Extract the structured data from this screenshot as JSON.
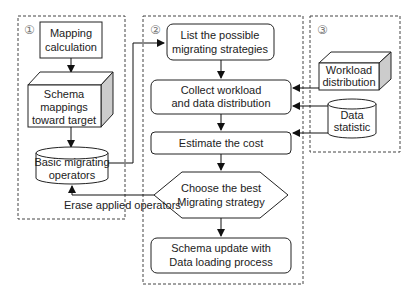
{
  "sections": [
    {
      "id": "1",
      "marker": "①"
    },
    {
      "id": "2",
      "marker": "②"
    },
    {
      "id": "3",
      "marker": "③"
    }
  ],
  "section1": {
    "mapping_calc": [
      "Mapping",
      "calculation"
    ],
    "schema_mappings": [
      "Schema",
      "mappings",
      "toward target"
    ],
    "basic_ops": [
      "Basic migrating",
      "operators"
    ]
  },
  "section2": {
    "list_strategies": [
      "List the possible",
      "migrating strategies"
    ],
    "collect": [
      "Collect workload",
      "and data distribution"
    ],
    "estimate": [
      "Estimate the cost"
    ],
    "choose": [
      "Choose the best",
      "Migrating strategy"
    ],
    "schema_update": [
      "Schema update with",
      "Data loading process"
    ]
  },
  "section3": {
    "workload": [
      "Workload",
      "distribution"
    ],
    "data_stat": [
      "Data",
      "statistic"
    ]
  },
  "edge_labels": {
    "erase": "Erase applied operators"
  }
}
